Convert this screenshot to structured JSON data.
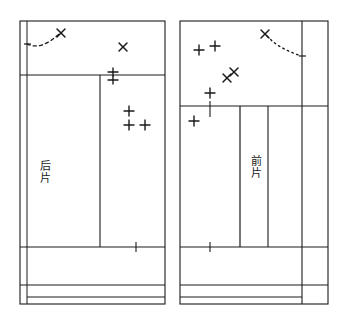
{
  "diagram": {
    "type": "garment-pattern-layout",
    "canvas": {
      "width": 347,
      "height": 321,
      "background": "#ffffff"
    },
    "ink_color": "#1a1a1a",
    "panels": [
      {
        "id": "back-panel",
        "label": "后片",
        "label_chars": [
          "后",
          "片"
        ],
        "frame": {
          "x": 20,
          "y": 21,
          "width": 145,
          "height": 283
        },
        "inner_left_rule_x": 27,
        "horizontal_rules_y": [
          75,
          247,
          285,
          297
        ],
        "vertical_rules_x": [
          100
        ],
        "vertical_rule_span": {
          "top": 75,
          "bottom": 247
        },
        "tick_marks": [
          {
            "x": 136,
            "y": 247,
            "length": 10
          }
        ]
      },
      {
        "id": "front-panel",
        "label": "前片",
        "label_chars": [
          "前",
          "片"
        ],
        "frame": {
          "x": 180,
          "y": 21,
          "width": 148,
          "height": 283
        },
        "inner_right_rule_x": 302,
        "horizontal_rules_y": [
          106,
          247,
          285,
          297
        ],
        "vertical_rules_x": [
          240,
          268
        ],
        "vertical_rule_span": {
          "top": 106,
          "bottom": 247
        },
        "tick_marks": [
          {
            "x": 210,
            "y": 106,
            "length": 10
          },
          {
            "x": 210,
            "y": 247,
            "length": 10
          }
        ]
      }
    ],
    "marks": {
      "cross_marks": [
        {
          "panel": "back-panel",
          "x": 61,
          "y": 33
        },
        {
          "panel": "back-panel",
          "x": 123,
          "y": 47
        },
        {
          "panel": "front-panel",
          "x": 265,
          "y": 34
        },
        {
          "panel": "front-panel",
          "x": 234,
          "y": 72
        },
        {
          "panel": "front-panel",
          "x": 227,
          "y": 78
        }
      ],
      "plus_marks": [
        {
          "panel": "back-panel",
          "x": 113,
          "y": 72
        },
        {
          "panel": "back-panel",
          "x": 113,
          "y": 80
        },
        {
          "panel": "back-panel",
          "x": 129,
          "y": 111
        },
        {
          "panel": "back-panel",
          "x": 129,
          "y": 125
        },
        {
          "panel": "back-panel",
          "x": 145,
          "y": 125
        },
        {
          "panel": "front-panel",
          "x": 199,
          "y": 50
        },
        {
          "panel": "front-panel",
          "x": 215,
          "y": 46
        },
        {
          "panel": "front-panel",
          "x": 210,
          "y": 93
        },
        {
          "panel": "front-panel",
          "x": 194,
          "y": 121
        }
      ],
      "dashed_curves": [
        {
          "panel": "back-panel",
          "style": "dashed",
          "path": "M 27,44 C 38,49 48,44 59,34",
          "end_cross": {
            "x": 61,
            "y": 33
          },
          "start_tick": {
            "x": 27,
            "y": 44
          }
        },
        {
          "panel": "front-panel",
          "style": "dotted",
          "path": "M 267,36 C 277,47 290,52 301,56",
          "end_cross": {
            "x": 265,
            "y": 34
          },
          "end_tick": {
            "x": 302,
            "y": 56
          }
        }
      ]
    }
  }
}
